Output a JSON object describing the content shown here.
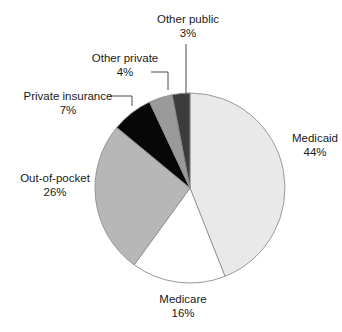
{
  "chart_data": {
    "type": "pie",
    "title": "",
    "subtitle": "",
    "xlabel": "",
    "ylabel": "",
    "legend_position": "none",
    "grid": false,
    "unit": "%",
    "categories": [
      "Medicaid",
      "Medicare",
      "Out-of-pocket",
      "Private insurance",
      "Other private",
      "Other public"
    ],
    "values": [
      44,
      16,
      26,
      7,
      4,
      3
    ],
    "slices": [
      {
        "label": "Medicaid",
        "value": 44,
        "value_text": "44%",
        "color": "#e9e9e9",
        "start_angle_deg": 0,
        "end_angle_deg": 158.4,
        "label_anchor": "right",
        "leader_line": false
      },
      {
        "label": "Medicare",
        "value": 16,
        "value_text": "16%",
        "color": "#ffffff",
        "start_angle_deg": 158.4,
        "end_angle_deg": 216.0,
        "label_anchor": "bottom",
        "leader_line": false
      },
      {
        "label": "Out-of-pocket",
        "value": 26,
        "value_text": "26%",
        "color": "#b7b7b7",
        "start_angle_deg": 216.0,
        "end_angle_deg": 309.6,
        "label_anchor": "left",
        "leader_line": false
      },
      {
        "label": "Private insurance",
        "value": 7,
        "value_text": "7%",
        "color": "#070707",
        "start_angle_deg": 309.6,
        "end_angle_deg": 334.8,
        "label_anchor": "left",
        "leader_line": true
      },
      {
        "label": "Other private",
        "value": 4,
        "value_text": "4%",
        "color": "#9a9a9a",
        "start_angle_deg": 334.8,
        "end_angle_deg": 349.2,
        "label_anchor": "top-left",
        "leader_line": true
      },
      {
        "label": "Other public",
        "value": 3,
        "value_text": "3%",
        "color": "#3c3c3c",
        "start_angle_deg": 349.2,
        "end_angle_deg": 360.0,
        "label_anchor": "top",
        "leader_line": true
      }
    ],
    "geometry": {
      "center_x": 190,
      "center_y": 188,
      "radius": 95,
      "outline_color": "#8f8f8f"
    }
  },
  "labels": {
    "medicaid": {
      "name": "Medicaid",
      "pct": "44%"
    },
    "medicare": {
      "name": "Medicare",
      "pct": "16%"
    },
    "out_of_pocket": {
      "name": "Out-of-pocket",
      "pct": "26%"
    },
    "private_insurance": {
      "name": "Private insurance",
      "pct": "7%"
    },
    "other_private": {
      "name": "Other private",
      "pct": "4%"
    },
    "other_public": {
      "name": "Other public",
      "pct": "3%"
    }
  }
}
